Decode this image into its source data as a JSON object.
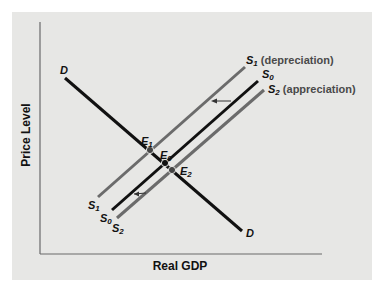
{
  "axes": {
    "x_label": "Real GDP",
    "y_label": "Price Level"
  },
  "curves": {
    "demand": {
      "label": "D",
      "color": "#111111"
    },
    "s0": {
      "label": "S",
      "sub": "0",
      "color": "#111111"
    },
    "s1": {
      "label": "S",
      "sub": "1",
      "suffix": " (depreciation)",
      "color": "#6b6b6b"
    },
    "s2": {
      "label": "S",
      "sub": "2",
      "suffix": " (appreciation)",
      "color": "#6b6b6b"
    }
  },
  "points": {
    "e0": {
      "label": "E",
      "sub": "0"
    },
    "e1": {
      "label": "E",
      "sub": "1"
    },
    "e2": {
      "label": "E",
      "sub": "2"
    }
  },
  "colors": {
    "panel": "#e7e7e5",
    "axis": "#6a6a6a",
    "black_line": "#111111",
    "gray_line": "#6b6b6b"
  }
}
